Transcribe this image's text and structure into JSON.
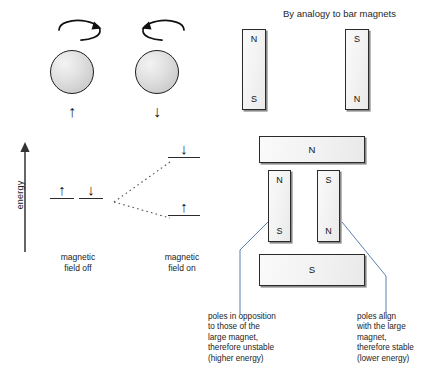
{
  "figure": {
    "spin_block": {
      "particles": [
        {
          "spin_label": "↑",
          "rotation_icon": "clockwise-spin-arrow-icon",
          "name": "spin-up"
        },
        {
          "spin_label": "↓",
          "rotation_icon": "counterclockwise-spin-arrow-icon",
          "name": "spin-down"
        }
      ]
    },
    "energy_diagram": {
      "axis_label": "energy",
      "axis_arrow_icon": "up-arrow-icon",
      "field_off": {
        "caption": "magnetic\nfield off",
        "levels": [
          {
            "glyph": "↑"
          },
          {
            "glyph": "↓"
          }
        ]
      },
      "field_on": {
        "caption": "magnetic\nfield on",
        "levels": [
          {
            "glyph": "↓",
            "position": "upper",
            "energy": "higher"
          },
          {
            "glyph": "↑",
            "position": "lower",
            "energy": "lower"
          }
        ]
      }
    },
    "bar_magnet_analogy": {
      "title": "By analogy to bar magnets",
      "magnets": [
        {
          "name": "bar-magnet-left",
          "top_pole": "N",
          "bottom_pole": "S"
        },
        {
          "name": "bar-magnet-right",
          "top_pole": "S",
          "bottom_pole": "N"
        }
      ]
    },
    "large_magnet_assembly": {
      "top_magnet_pole": "N",
      "bottom_magnet_pole": "S",
      "small_magnets": [
        {
          "name": "small-magnet-left",
          "top_pole": "N",
          "bottom_pole": "S"
        },
        {
          "name": "small-magnet-right",
          "top_pole": "S",
          "bottom_pole": "N"
        }
      ],
      "captions": [
        {
          "name": "caption-unstable",
          "text": "poles in opposition\nto those of the\nlarge magnet,\ntherefore unstable\n(higher energy)"
        },
        {
          "name": "caption-stable",
          "text": "poles align\nwith the large\nmagnet,\ntherefore stable\n(lower energy)"
        }
      ]
    }
  },
  "colors": {
    "stroke": "#2a2a2a",
    "magnet_fill": "#f4f4f4",
    "sphere_fill": "#dcdcdc",
    "text": "#1a1a1a"
  }
}
